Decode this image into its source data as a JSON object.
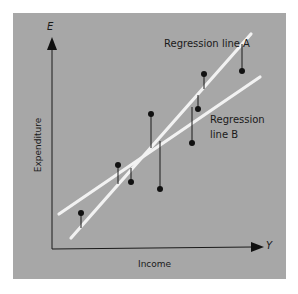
{
  "chart_data": {
    "type": "scatter",
    "title": "",
    "xlabel": "Income",
    "ylabel": "Expenditure",
    "x_axis_symbol": "Y",
    "y_axis_symbol": "E",
    "grid": false,
    "ticks": "none",
    "points_px": [
      {
        "x": 81,
        "y": 213,
        "stem_to": 228
      },
      {
        "x": 118,
        "y": 165,
        "stem_to": 184
      },
      {
        "x": 131,
        "y": 182,
        "stem_to": 168
      },
      {
        "x": 151,
        "y": 114,
        "stem_to": 148
      },
      {
        "x": 160,
        "y": 189,
        "stem_to": 141
      },
      {
        "x": 192,
        "y": 143,
        "stem_to": 107
      },
      {
        "x": 198,
        "y": 109,
        "stem_to": 95
      },
      {
        "x": 204,
        "y": 74,
        "stem_to": 89
      },
      {
        "x": 242,
        "y": 71,
        "stem_to": 44
      }
    ],
    "lines": [
      {
        "name": "Regression line A",
        "x1": 71,
        "y1": 238,
        "x2": 251,
        "y2": 34
      },
      {
        "name": "Regression line B",
        "x1": 59,
        "y1": 214,
        "x2": 260,
        "y2": 77
      }
    ],
    "annotations": [
      "Regression line A",
      "Regression line B"
    ]
  },
  "labels": {
    "y_symbol": "E",
    "x_symbol": "Y",
    "line_a": "Regression line A",
    "line_b_1": "Regression",
    "line_b_2": "line B",
    "x_title": "Income",
    "y_title": "Expenditure"
  },
  "colors": {
    "panel": "#a7a7a7",
    "lines": "#f2f2f2",
    "points": "#111111"
  }
}
